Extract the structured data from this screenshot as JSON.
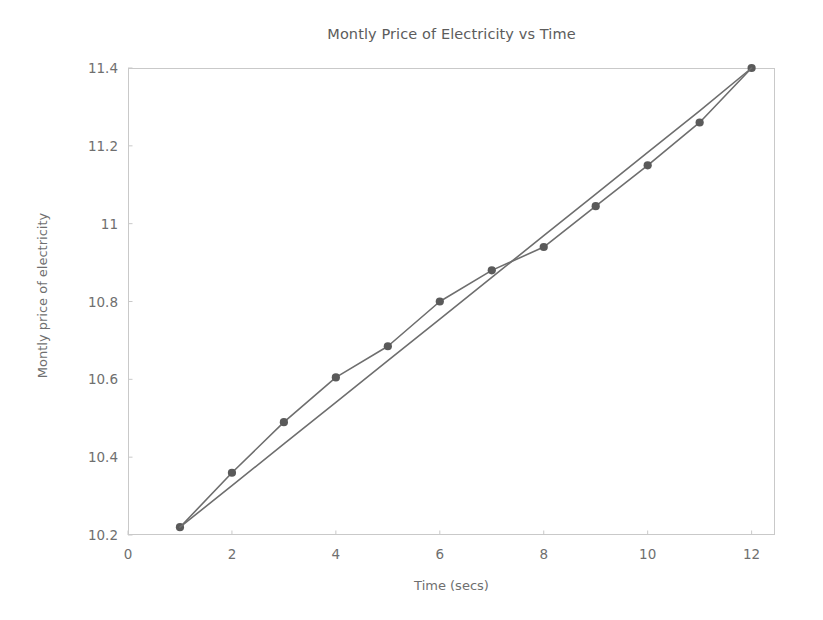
{
  "chart_data": {
    "type": "line",
    "title": "Montly Price of Electricity vs Time",
    "xlabel": "Time (secs)",
    "ylabel": "Montly price of electricity",
    "xlim": [
      0,
      12.45
    ],
    "ylim": [
      10.2,
      11.4
    ],
    "xticks": [
      0,
      2,
      4,
      6,
      8,
      10,
      12
    ],
    "xtick_labels": [
      "0",
      "2",
      "4",
      "6",
      "8",
      "10",
      "12"
    ],
    "yticks": [
      10.2,
      10.4,
      10.6,
      10.8,
      11.0,
      11.2,
      11.4
    ],
    "ytick_labels": [
      "10.2",
      "10.4",
      "10.6",
      "10.8",
      "11",
      "11.2",
      "11.4"
    ],
    "grid": false,
    "legend": null,
    "x": [
      1,
      2,
      3,
      4,
      5,
      6,
      7,
      8,
      9,
      10,
      11,
      12
    ],
    "series": [
      {
        "name": "Monthly price of electricity",
        "marker": "circle",
        "color": "#6e6e6e",
        "values": [
          10.22,
          10.36,
          10.49,
          10.605,
          10.685,
          10.8,
          10.88,
          10.94,
          11.045,
          11.15,
          11.26,
          11.4
        ]
      },
      {
        "name": "Trend line",
        "marker": "none",
        "color": "#6e6e6e",
        "values": [
          10.22,
          10.327,
          10.434,
          10.541,
          10.648,
          10.755,
          10.862,
          10.969,
          11.076,
          11.183,
          11.29,
          11.4
        ]
      }
    ],
    "colors": {
      "line": "#6e6e6e",
      "marker": "#5a5a5a",
      "axis": "#c9c9c9",
      "text": "#6f6f6f",
      "background": "#ffffff"
    }
  }
}
